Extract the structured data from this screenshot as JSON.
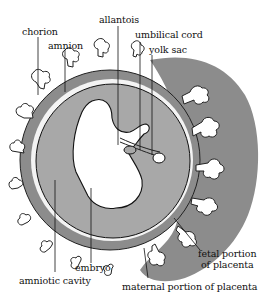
{
  "diagram": {
    "type": "anatomical-illustration",
    "colors": {
      "background": "#ffffff",
      "tissue_gray": "#8a8a8a",
      "cavity_gray": "#a9a9a9",
      "embryo_fill": "#ffffff",
      "outline": "#111111"
    },
    "labels": {
      "chorion": "chorion",
      "amnion": "amnion",
      "allantois": "allantois",
      "umbilical_cord": "umbilical cord",
      "yolk_sac": "yolk sac",
      "fetal_portion_line1": "fetal portion",
      "fetal_portion_line2": "of placenta",
      "maternal_portion": "maternal portion of placenta",
      "embryo": "embryo",
      "amniotic_cavity": "amniotic cavity"
    }
  }
}
